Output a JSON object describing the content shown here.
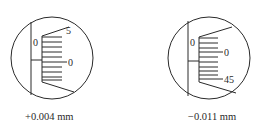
{
  "figures": [
    {
      "id": "left",
      "caption": "+0.004 mm",
      "sleeve_label": "0",
      "thimble_labels": {
        "upper": "5",
        "middle": "0"
      }
    },
    {
      "id": "right",
      "caption": "−0.011 mm",
      "sleeve_label": "0",
      "thimble_labels": {
        "upper": "0",
        "lower": "45"
      }
    }
  ],
  "colors": {
    "line": "#2a2a2a",
    "background": "#ffffff"
  }
}
